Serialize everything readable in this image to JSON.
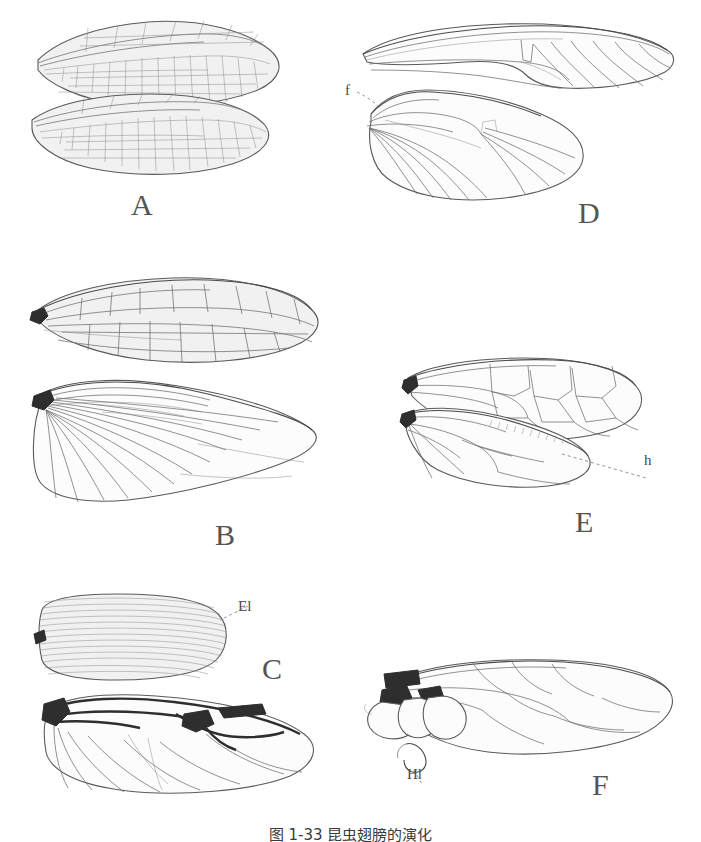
{
  "figure": {
    "caption": "图 1-33 昆虫翅膀的演化",
    "type": "scientific-line-drawing",
    "background_color": "#ffffff",
    "ink_color": "#4a4a4a"
  },
  "panels": [
    {
      "id": "A",
      "label": "A",
      "label_x": 131,
      "label_y": 188,
      "description": "pair of elongate net-veined membranous wings",
      "wing_count": 2,
      "part_labels": []
    },
    {
      "id": "D",
      "label": "D",
      "label_x": 578,
      "label_y": 196,
      "description": "fore and hind wing with frenulum coupling",
      "wing_count": 2,
      "part_labels": [
        {
          "text": "f",
          "x": 345,
          "y": 82,
          "meaning": "frenulum"
        }
      ]
    },
    {
      "id": "B",
      "label": "B",
      "label_x": 215,
      "label_y": 518,
      "description": "tegmen forewing above broad fan-folded hindwing",
      "wing_count": 2,
      "part_labels": []
    },
    {
      "id": "E",
      "label": "E",
      "label_x": 575,
      "label_y": 505,
      "description": "hymenopteran fore and hind wing linked by hamuli",
      "wing_count": 2,
      "part_labels": [
        {
          "text": "h",
          "x": 644,
          "y": 452,
          "meaning": "hamuli"
        }
      ]
    },
    {
      "id": "C",
      "label": "C",
      "label_x": 262,
      "label_y": 652,
      "description": "beetle elytron above folded membranous hindwing",
      "wing_count": 2,
      "part_labels": [
        {
          "text": "El",
          "x": 238,
          "y": 598,
          "meaning": "elytron"
        }
      ]
    },
    {
      "id": "F",
      "label": "F",
      "label_x": 592,
      "label_y": 768,
      "description": "dipteran forewing with reduced hindwing halter",
      "wing_count": 1,
      "part_labels": [
        {
          "text": "Hl",
          "x": 407,
          "y": 766,
          "meaning": "halter"
        }
      ]
    }
  ]
}
